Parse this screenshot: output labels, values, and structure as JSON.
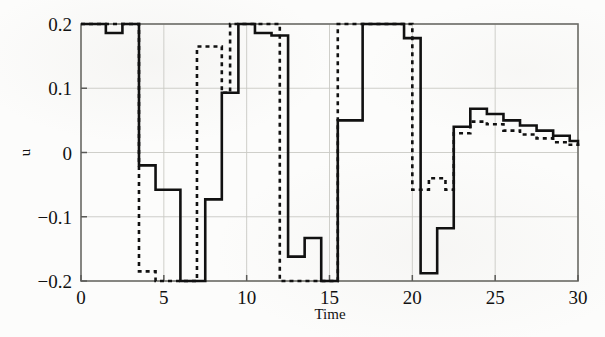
{
  "figure": {
    "background_color": "#fcfcfb",
    "ink_color": "#111111",
    "grid_color": "#c9c9c4"
  },
  "axes": {
    "x_label": "Time",
    "y_label": "u",
    "x_ticks": [
      "0",
      "5",
      "10",
      "15",
      "20",
      "25",
      "30"
    ],
    "x_tick_values": [
      0,
      5,
      10,
      15,
      20,
      25,
      30
    ],
    "y_ticks": [
      "0.2",
      "0.1",
      "0",
      "-0.1",
      "-0.2"
    ],
    "y_tick_values": [
      0.2,
      0.1,
      0,
      -0.1,
      -0.2
    ],
    "x_range": [
      0,
      30
    ],
    "y_range": [
      -0.2,
      0.2
    ],
    "grid": true
  },
  "chart_data": {
    "type": "line",
    "title": "",
    "subtitle": "",
    "xlabel": "Time",
    "ylabel": "u",
    "xlim": [
      0,
      30
    ],
    "ylim": [
      -0.2,
      0.2
    ],
    "grid": true,
    "legend": [],
    "legend_position": "none",
    "interpolation": "step-post",
    "annotations": [],
    "series": [
      {
        "name": "solid-trace",
        "style": "solid",
        "color": "#111111",
        "width": 2.6,
        "x": [
          0.0,
          1.0,
          1.5,
          2.0,
          2.5,
          3.0,
          3.5,
          4.0,
          4.5,
          5.0,
          6.0,
          7.0,
          7.5,
          8.0,
          8.5,
          9.0,
          9.5,
          10.0,
          10.5,
          11.0,
          11.5,
          12.0,
          12.5,
          13.0,
          13.5,
          14.0,
          14.5,
          15.0,
          15.5,
          16.0,
          17.0,
          18.0,
          18.5,
          19.0,
          19.5,
          20.0,
          20.5,
          21.0,
          21.5,
          22.0,
          22.5,
          23.0,
          23.5,
          24.0,
          24.5,
          25.0,
          25.5,
          26.0,
          26.5,
          27.0,
          27.5,
          28.0,
          28.5,
          29.0,
          29.5,
          30.0
        ],
        "y": [
          0.2,
          0.2,
          0.186,
          0.186,
          0.2,
          0.2,
          -0.02,
          -0.02,
          -0.058,
          -0.058,
          -0.2,
          -0.2,
          -0.073,
          -0.073,
          0.093,
          0.093,
          0.2,
          0.2,
          0.186,
          0.186,
          0.182,
          0.182,
          -0.162,
          -0.162,
          -0.133,
          -0.133,
          -0.2,
          -0.2,
          0.05,
          0.05,
          0.2,
          0.2,
          0.2,
          0.2,
          0.178,
          0.178,
          -0.188,
          -0.188,
          -0.118,
          -0.118,
          0.04,
          0.04,
          0.068,
          0.068,
          0.06,
          0.06,
          0.05,
          0.05,
          0.042,
          0.042,
          0.034,
          0.034,
          0.026,
          0.026,
          0.018,
          0.01
        ]
      },
      {
        "name": "dashed-trace",
        "style": "dashed",
        "color": "#111111",
        "width": 2.6,
        "dash": "4,4",
        "x": [
          0.0,
          1.0,
          1.5,
          2.0,
          2.5,
          3.0,
          3.5,
          4.0,
          4.5,
          5.0,
          6.0,
          6.8,
          7.0,
          7.5,
          8.0,
          8.5,
          9.0,
          9.5,
          10.0,
          10.5,
          11.0,
          11.5,
          12.0,
          13.0,
          13.5,
          14.0,
          14.5,
          15.0,
          15.5,
          16.0,
          17.0,
          18.0,
          18.5,
          19.0,
          19.5,
          20.0,
          20.5,
          21.0,
          21.5,
          22.0,
          22.5,
          23.0,
          23.5,
          24.0,
          24.5,
          25.0,
          25.5,
          26.0,
          26.5,
          27.0,
          27.5,
          28.0,
          28.5,
          29.0,
          29.5,
          30.0
        ],
        "y": [
          0.2,
          0.2,
          0.2,
          0.2,
          0.2,
          0.2,
          -0.185,
          -0.185,
          -0.2,
          -0.2,
          -0.2,
          -0.2,
          0.165,
          0.165,
          0.165,
          0.093,
          0.2,
          0.2,
          0.2,
          0.2,
          0.2,
          0.2,
          -0.2,
          -0.2,
          -0.2,
          -0.2,
          -0.2,
          -0.2,
          0.2,
          0.2,
          0.2,
          0.2,
          0.2,
          0.2,
          0.2,
          -0.058,
          -0.058,
          -0.04,
          -0.04,
          -0.058,
          0.03,
          0.03,
          0.048,
          0.048,
          0.044,
          0.044,
          0.034,
          0.034,
          0.028,
          0.028,
          0.022,
          0.022,
          0.016,
          0.016,
          0.012,
          0.01
        ]
      }
    ]
  }
}
